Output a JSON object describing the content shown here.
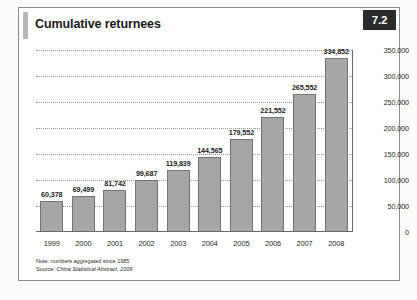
{
  "figure": {
    "title": "Cumulative returnees",
    "number": "7.2"
  },
  "notes": {
    "note": "Note: numbers aggregated since 1985",
    "source_label": "Source: ",
    "source_italic": "China Statistical Abstract, 2009"
  },
  "chart_data": {
    "type": "bar",
    "title": "Cumulative returnees",
    "xlabel": "",
    "ylabel": "",
    "categories": [
      "1999",
      "2000",
      "2001",
      "2002",
      "2003",
      "2004",
      "2005",
      "2006",
      "2007",
      "2008"
    ],
    "values": [
      60378,
      69499,
      81742,
      99687,
      119839,
      144565,
      179552,
      221552,
      265552,
      334852
    ],
    "value_labels": [
      "60,378",
      "69,499",
      "81,742",
      "99,687",
      "119,839",
      "144,565",
      "179,552",
      "221,552",
      "265,552",
      "334,852"
    ],
    "ylim": [
      0,
      350000
    ],
    "yticks": [
      0,
      50000,
      100000,
      150000,
      200000,
      250000,
      300000,
      350000
    ],
    "ytick_labels": [
      "0",
      "50,000",
      "100,000",
      "150,000",
      "200,000",
      "250,000",
      "300,000",
      "350,000"
    ],
    "grid": true,
    "grid_style": "dotted-horizontal",
    "legend": "none",
    "bar_color": "#a6a6a6",
    "bar_border_color": "#747474",
    "axis_position": "right"
  },
  "colors": {
    "badge_background": "#2b2b2b",
    "badge_text": "#ffffff",
    "title_accent": "#b7b7b7",
    "frame_border": "#8e8e8e",
    "axis_line": "#6b6b6b",
    "grid_line": "#9a9a9a"
  }
}
